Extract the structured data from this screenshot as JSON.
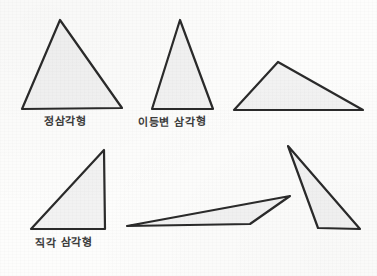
{
  "page": {
    "background_color": "#fdfdfc",
    "width": 377,
    "height": 276
  },
  "style": {
    "stroke_color": "#2a2a2a",
    "fill_color": "#f2f2f2",
    "stroke_width": 2.2,
    "label_color": "#2b2b2b"
  },
  "labels": {
    "equilateral": "정삼각형",
    "isosceles": "이등변 삼각형",
    "right": "직각 삼각형"
  },
  "figures": [
    {
      "name": "equilateral-triangle",
      "label": "정삼각형",
      "points": "60,20 122,108 22,109",
      "fill": "#f2f2f2",
      "stroke": "#2a2a2a"
    },
    {
      "name": "isosceles-triangle",
      "label": "이등변 삼각형",
      "points": "180,20 213,109 152,109",
      "fill": "#f2f2f2",
      "stroke": "#2a2a2a"
    },
    {
      "name": "obtuse-scalene-triangle",
      "label": "",
      "points": "278,62 363,110 234,110",
      "fill": "#f2f2f2",
      "stroke": "#2a2a2a"
    },
    {
      "name": "right-triangle",
      "label": "직각 삼각형",
      "points": "104,150 105,229 31,229",
      "fill": "#f2f2f2",
      "stroke": "#2a2a2a"
    },
    {
      "name": "sliver-triangle",
      "label": "",
      "points": "290,196 250,224 127,226",
      "fill": "#f2f2f2",
      "stroke": "#2a2a2a"
    },
    {
      "name": "narrow-tall-triangle",
      "label": "",
      "points": "288,146 360,229 318,228",
      "fill": "#f2f2f2",
      "stroke": "#2a2a2a"
    }
  ]
}
